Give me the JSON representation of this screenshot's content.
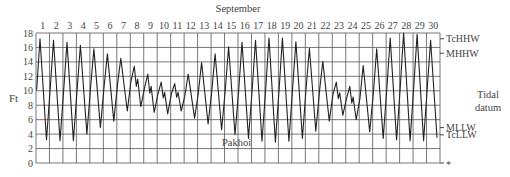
{
  "chart_data": {
    "type": "line",
    "title": "September",
    "ylabel": "Ft",
    "xlabel": "",
    "ylim": [
      0,
      18
    ],
    "yticks": [
      0,
      2,
      4,
      6,
      8,
      10,
      12,
      14,
      16,
      18
    ],
    "days": [
      1,
      2,
      3,
      4,
      5,
      6,
      7,
      8,
      9,
      10,
      11,
      12,
      13,
      14,
      15,
      16,
      17,
      18,
      19,
      20,
      21,
      22,
      23,
      24,
      25,
      26,
      27,
      28,
      29,
      30
    ],
    "grid": true,
    "annotation": "Pakhoi",
    "right_axis_title": "Tidal datum",
    "datum_marks": [
      {
        "label": "TcHHW",
        "value": 17.2
      },
      {
        "label": "MHHW",
        "value": 15.2
      },
      {
        "label": "MLLW",
        "value": 4.9
      },
      {
        "label": "TcLLW",
        "value": 3.9
      },
      {
        "label": "*",
        "value": 0
      }
    ],
    "series": [
      {
        "name": "Pakhoi tide height",
        "daily_high": [
          17.2,
          17.0,
          16.7,
          16.3,
          15.8,
          15.1,
          14.5,
          13.4,
          12.3,
          11.2,
          11.0,
          12.3,
          13.9,
          15.1,
          16.1,
          16.7,
          17.0,
          17.3,
          17.3,
          16.8,
          15.9,
          14.1,
          11.2,
          10.6,
          13.5,
          15.8,
          17.3,
          18.0,
          17.8,
          17.0
        ],
        "daily_low": [
          3.2,
          3.1,
          3.1,
          4.0,
          4.9,
          5.8,
          7.2,
          7.8,
          7.0,
          6.8,
          7.2,
          6.2,
          5.4,
          4.6,
          3.9,
          3.4,
          3.0,
          2.9,
          3.0,
          3.4,
          4.4,
          5.8,
          6.6,
          6.0,
          4.3,
          3.4,
          3.2,
          3.1,
          3.1,
          3.5
        ]
      }
    ]
  }
}
